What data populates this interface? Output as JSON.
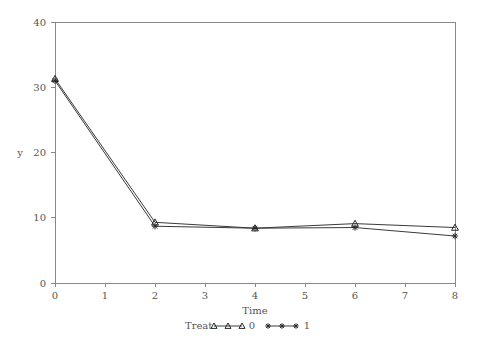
{
  "chart_data": {
    "type": "line",
    "title": "",
    "xlabel": "Time",
    "ylabel": "y",
    "xlim": [
      0,
      8
    ],
    "ylim": [
      0,
      40
    ],
    "xticks": [
      "0",
      "1",
      "2",
      "3",
      "4",
      "5",
      "6",
      "7",
      "8"
    ],
    "yticks": [
      "0",
      "10",
      "20",
      "30",
      "40"
    ],
    "grid": false,
    "legend_position": "bottom",
    "legend_title": "Treat",
    "x": [
      0,
      2,
      4,
      6,
      8
    ],
    "series": [
      {
        "name": "0",
        "marker": "triangle",
        "values": [
          31.3,
          9.3,
          8.4,
          9.1,
          8.5
        ]
      },
      {
        "name": "1",
        "marker": "star",
        "values": [
          31.0,
          8.7,
          8.4,
          8.5,
          7.2
        ]
      }
    ]
  },
  "axes": {
    "y_axis_title": "y",
    "x_axis_title": "Time",
    "y_tick_0": "0",
    "y_tick_1": "10",
    "y_tick_2": "20",
    "y_tick_3": "30",
    "y_tick_4": "40",
    "x_tick_0": "0",
    "x_tick_1": "1",
    "x_tick_2": "2",
    "x_tick_3": "3",
    "x_tick_4": "4",
    "x_tick_5": "5",
    "x_tick_6": "6",
    "x_tick_7": "7",
    "x_tick_8": "8"
  },
  "legend": {
    "title": "Treat",
    "entry_0_label": "0",
    "entry_1_label": "1"
  },
  "colors": {
    "axis": "#888888",
    "line": "#3a3a3a",
    "text": "#555555",
    "background": "#ffffff"
  }
}
